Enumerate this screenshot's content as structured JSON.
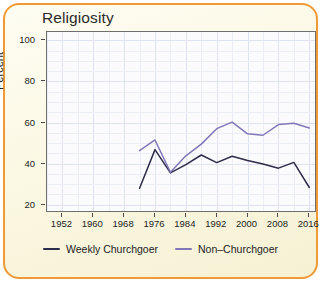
{
  "card": {
    "title": "Religiosity",
    "border_color": "#ef9a34",
    "background_color": "#fbf8e4"
  },
  "legend": {
    "position": "bottom-center",
    "items": [
      {
        "label": "Weekly Churchgoer",
        "color": "#2f2b4a"
      },
      {
        "label": "Non–Churchgoer",
        "color": "#8278b8"
      }
    ]
  },
  "chart_data": {
    "type": "line",
    "title": "Religiosity",
    "xlabel": "",
    "ylabel": "Percent",
    "xlim": [
      1948,
      2018
    ],
    "ylim": [
      16,
      104
    ],
    "xticks": [
      1952,
      1960,
      1968,
      1976,
      1984,
      1992,
      2000,
      2008,
      2016
    ],
    "yticks": [
      20,
      40,
      60,
      80,
      100
    ],
    "grid": true,
    "x": [
      1972,
      1976,
      1980,
      1984,
      1988,
      1992,
      1996,
      2000,
      2004,
      2008,
      2012,
      2016
    ],
    "series": [
      {
        "name": "Weekly Churchgoer",
        "color": "#2f2b4a",
        "values": [
          28.0,
          46.8,
          35.5,
          39.5,
          44.2,
          40.5,
          43.6,
          41.5,
          39.8,
          37.8,
          40.6,
          28.4
        ]
      },
      {
        "name": "Non–Churchgoer",
        "color": "#8278b8",
        "values": [
          46.3,
          51.5,
          35.8,
          43.8,
          49.5,
          57.0,
          60.2,
          54.5,
          53.8,
          59.0,
          59.6,
          57.3
        ]
      }
    ]
  }
}
